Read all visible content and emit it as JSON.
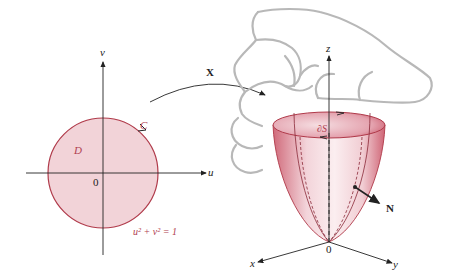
{
  "left_panel": {
    "axis_u_label": "u",
    "axis_v_label": "v",
    "origin_label": "0",
    "region_label": "D",
    "curve_label": "C",
    "equation": "u² + v² = 1"
  },
  "mapping": {
    "label": "X"
  },
  "right_panel": {
    "axis_x_label": "x",
    "axis_y_label": "y",
    "axis_z_label": "z",
    "origin_label": "0",
    "boundary_label": "∂S",
    "normal_label": "N"
  },
  "colors": {
    "fill_pink": "#f2d3d8",
    "stroke_red": "#b03a4a",
    "surface_dark": "#c9586a",
    "hand_gray": "#b8b8b8",
    "axis": "#222222"
  }
}
